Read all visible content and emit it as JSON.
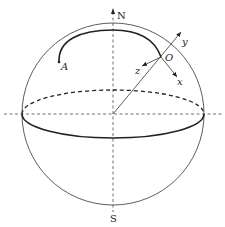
{
  "diagram": {
    "labels": {
      "north": "N",
      "south": "S",
      "point_a": "A",
      "origin": "O",
      "axis_x": "x",
      "axis_y": "y",
      "axis_z": "z"
    },
    "colors": {
      "stroke": "#222222",
      "background": "#ffffff"
    }
  }
}
